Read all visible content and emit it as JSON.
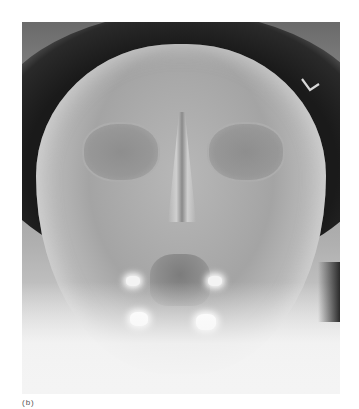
{
  "image": {
    "type": "radiograph",
    "view": "skull frontal / occipitomental",
    "side_marker": "L",
    "caption": "(b)"
  },
  "colors": {
    "background": "#ffffff",
    "film_dark": "#1a1a1a",
    "bone_mid": "#a4a4a4",
    "bright_metal": "#ffffff",
    "marker": "#d8d8d8"
  }
}
